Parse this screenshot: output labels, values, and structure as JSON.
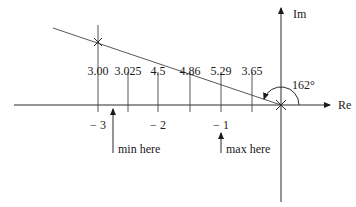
{
  "diagram": {
    "axes": {
      "real_label": "Re",
      "imag_label": "Im"
    },
    "real_axis_ticks": [
      {
        "value": -3,
        "label": "− 3"
      },
      {
        "value": -2,
        "label": "− 2"
      },
      {
        "value": -1,
        "label": "− 1"
      }
    ],
    "gain_labels": [
      "3.00",
      "3.025",
      "4.5",
      "4.86",
      "5.29",
      "3.65"
    ],
    "angle_label": "162°",
    "annotations": {
      "min": "min here",
      "max": "max here"
    },
    "markers": [
      {
        "name": "pole-upper-left",
        "symbol": "×"
      },
      {
        "name": "pole-origin",
        "symbol": "×"
      }
    ]
  }
}
